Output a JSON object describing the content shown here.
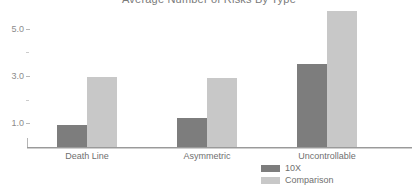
{
  "chart_data": {
    "type": "bar",
    "title": "Average Number of Risks By Type",
    "xlabel": "",
    "ylabel": "",
    "categories": [
      "Death Line",
      "Asymmetric",
      "Uncontrollable"
    ],
    "series": [
      {
        "name": "10X",
        "color": "#7d7d7d",
        "values": [
          0.93,
          1.22,
          3.5
        ]
      },
      {
        "name": "Comparison",
        "color": "#c8c8c8",
        "values": [
          2.95,
          2.92,
          5.75
        ]
      }
    ],
    "ylim": [
      0,
      6.1
    ],
    "yticks": [
      1.0,
      2.0,
      3.0,
      4.0,
      5.0
    ],
    "ytick_labels": [
      "1.0",
      "",
      "3.0",
      "",
      "5.0"
    ],
    "ytick_major": [
      true,
      false,
      true,
      false,
      true
    ],
    "grid": false,
    "legend_position": "bottom-right",
    "orientation": "vertical",
    "grouped": true
  },
  "axis": {
    "tick_1": "1.0",
    "tick_2": "",
    "tick_3": "3.0",
    "tick_4": "",
    "tick_5": "5.0"
  },
  "legend": {
    "items": [
      {
        "label": "10X",
        "color": "#7d7d7d"
      },
      {
        "label": "Comparison",
        "color": "#c8c8c8"
      }
    ]
  }
}
